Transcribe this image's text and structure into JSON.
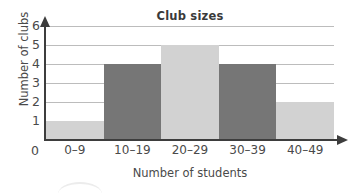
{
  "chart_data": {
    "type": "bar",
    "title": "Club sizes",
    "xlabel": "Number of students",
    "ylabel": "Number of clubs",
    "categories": [
      "0–9",
      "10–19",
      "20–29",
      "30–39",
      "40–49"
    ],
    "values": [
      1,
      4,
      5,
      4,
      2
    ],
    "ylim": [
      0,
      6
    ],
    "yticks": [
      "0",
      "1",
      "2",
      "3",
      "4",
      "5",
      "6"
    ],
    "origin_label": "0",
    "grid": true,
    "legend": "none",
    "bar_colors": [
      "#d2d2d2",
      "#767676",
      "#d2d2d2",
      "#767676",
      "#d2d2d2"
    ],
    "bar_styles": [
      "light",
      "dark",
      "light",
      "dark",
      "light"
    ],
    "colors": {
      "light_bar": "#d2d2d2",
      "dark_bar": "#767676",
      "gridline": "#bcbcbc",
      "axis": "#3d3d3d",
      "text": "#4a4a4a",
      "background": "#ffffff"
    }
  }
}
